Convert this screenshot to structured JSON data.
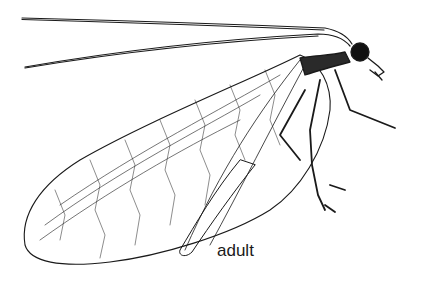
{
  "illustration": {
    "subject": "lacewing insect line drawing",
    "label": "adult",
    "ink_color": "#1a1a1a",
    "background": "#ffffff"
  }
}
